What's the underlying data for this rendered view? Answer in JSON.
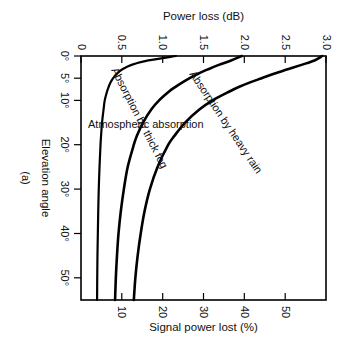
{
  "figure": {
    "caption": "(a)",
    "background_color": "#ffffff",
    "ink_color": "#000000"
  },
  "chart_data": {
    "type": "line",
    "title": "",
    "subtitle": "",
    "xlabel": "Elevation angle",
    "ylabel": "Power loss (dB)",
    "y2label": "Signal power lost (%)",
    "xlim": [
      0,
      55
    ],
    "ylim": [
      0,
      3.2
    ],
    "y2lim": [
      0,
      52
    ],
    "grid": false,
    "legend_position": "inline-curve-labels",
    "x_ticks": [
      {
        "value": 0,
        "label": "0°"
      },
      {
        "value": 5,
        "label": "5°"
      },
      {
        "value": 10,
        "label": "10°"
      },
      {
        "value": 20,
        "label": "20°"
      },
      {
        "value": 30,
        "label": "30°"
      },
      {
        "value": 40,
        "label": "40°"
      },
      {
        "value": 50,
        "label": "50°"
      }
    ],
    "y_ticks": [
      {
        "value": 0,
        "label": "0"
      },
      {
        "value": 0.5,
        "label": "0.5"
      },
      {
        "value": 1.0,
        "label": "1.0"
      },
      {
        "value": 1.5,
        "label": "1.5"
      },
      {
        "value": 2.0,
        "label": "2.0"
      },
      {
        "value": 2.5,
        "label": "2.5"
      },
      {
        "value": 3.0,
        "label": "3.0"
      }
    ],
    "y2_ticks": [
      {
        "value": 10,
        "label": "10"
      },
      {
        "value": 20,
        "label": "20"
      },
      {
        "value": 30,
        "label": "30"
      },
      {
        "value": 40,
        "label": "40"
      },
      {
        "value": 50,
        "label": "50"
      }
    ],
    "x": [
      0,
      1,
      2,
      3,
      4,
      5,
      6,
      7,
      8,
      10,
      12,
      15,
      18,
      20,
      25,
      30,
      35,
      40,
      45,
      50,
      55
    ],
    "series": [
      {
        "name": "Absorption by heavy rain",
        "label": "Absorption by heavy rain",
        "unit": "dB",
        "values": [
          3.15,
          3.05,
          2.88,
          2.7,
          2.52,
          2.36,
          2.2,
          2.06,
          1.94,
          1.72,
          1.55,
          1.36,
          1.22,
          1.14,
          1.0,
          0.9,
          0.83,
          0.78,
          0.74,
          0.71,
          0.69
        ]
      },
      {
        "name": "Absorption by thick fog",
        "label": "Absorption by thick fog",
        "unit": "dB",
        "values": [
          2.1,
          1.96,
          1.8,
          1.66,
          1.53,
          1.42,
          1.32,
          1.23,
          1.15,
          1.02,
          0.92,
          0.81,
          0.73,
          0.69,
          0.61,
          0.56,
          0.52,
          0.49,
          0.47,
          0.455,
          0.445
        ]
      },
      {
        "name": "Atmospheric absorption",
        "label": "Atmospheric absorption",
        "unit": "dB",
        "values": [
          1.24,
          0.88,
          0.66,
          0.54,
          0.47,
          0.42,
          0.385,
          0.36,
          0.34,
          0.31,
          0.295,
          0.275,
          0.262,
          0.255,
          0.242,
          0.232,
          0.225,
          0.22,
          0.215,
          0.212,
          0.21
        ]
      }
    ],
    "annotations": [
      {
        "text": "Absorption by heavy rain"
      },
      {
        "text": "Absorption by thick fog"
      },
      {
        "text": "Atmospheric absorption"
      },
      {
        "text": "(a)"
      }
    ]
  }
}
